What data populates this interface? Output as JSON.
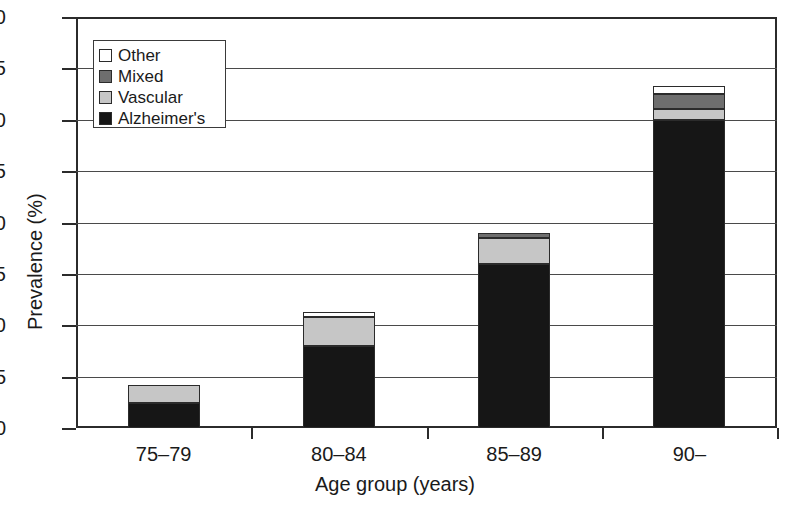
{
  "chart_data": {
    "type": "bar",
    "title": "",
    "subtitle": "",
    "stacked": true,
    "xlabel": "Age group (years)",
    "ylabel": "Prevalence (%)",
    "categories": [
      "75–79",
      "80–84",
      "85–89",
      "90–"
    ],
    "ylim": [
      0,
      40
    ],
    "yticks": [
      0,
      5,
      10,
      15,
      20,
      25,
      30,
      35,
      40
    ],
    "ytick_labels": [
      "0",
      "5",
      "10",
      "15",
      "20",
      "25",
      "30",
      "35",
      "40"
    ],
    "grid": "horizontal",
    "legend_position": "top-left",
    "series": [
      {
        "name": "Alzheimer's",
        "color": "#161616",
        "values": [
          2.4,
          8.0,
          16.0,
          30.0
        ]
      },
      {
        "name": "Vascular",
        "color": "#c6c6c6",
        "values": [
          1.8,
          2.8,
          2.5,
          1.0
        ]
      },
      {
        "name": "Mixed",
        "color": "#6e6e6e",
        "values": [
          0.0,
          0.0,
          0.5,
          1.5
        ]
      },
      {
        "name": "Other",
        "color": "#ffffff",
        "values": [
          0.0,
          0.5,
          0.0,
          0.8
        ]
      }
    ],
    "stack_order_bottom_to_top": [
      "Alzheimer's",
      "Vascular",
      "Mixed",
      "Other"
    ],
    "totals": [
      4.2,
      11.3,
      19.0,
      33.3
    ],
    "legend_entries": [
      {
        "label": "Other",
        "color": "#ffffff"
      },
      {
        "label": "Mixed",
        "color": "#6e6e6e"
      },
      {
        "label": "Vascular",
        "color": "#c6c6c6"
      },
      {
        "label": "Alzheimer's",
        "color": "#161616"
      }
    ]
  }
}
